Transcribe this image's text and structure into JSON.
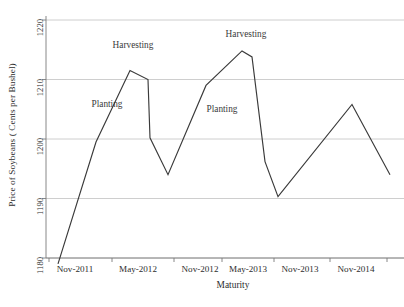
{
  "chart_data": {
    "type": "line",
    "title": "",
    "xlabel": "Maturity",
    "ylabel": "Price of Soybeans ( Cents per Bushel)",
    "ylim": [
      1180,
      1220
    ],
    "yticks": [
      1180,
      1190,
      1200,
      1210,
      1220
    ],
    "ytick_labels": [
      "1180",
      "1190",
      "1200",
      "1210",
      "1220"
    ],
    "grid": true,
    "gridlines": "horizontal",
    "legend": "none",
    "xtick_labels": [
      "Nov-2011",
      "May-2012",
      "Nov-2012",
      "May-2013",
      "Nov-2013",
      "Nov-2014"
    ],
    "xtick_px": [
      49,
      112,
      174,
      222,
      274,
      330
    ],
    "xtick_extra_px": [
      387
    ],
    "series": [
      {
        "name": "Soybean futures curve",
        "color": "#3a3a3a",
        "x": [
          58,
          96,
          130,
          148,
          150,
          168,
          206,
          242,
          252,
          265,
          278,
          352,
          390
        ],
        "values": [
          1179.0,
          1199.5,
          1211.5,
          1210.0,
          1200.2,
          1194.0,
          1209.0,
          1214.8,
          1213.8,
          1196.2,
          1190.3,
          1205.8,
          1194.0
        ]
      }
    ],
    "annotations": [
      {
        "text": "Harvesting",
        "x_px": 133,
        "y_px": 46
      },
      {
        "text": "Planting",
        "x_px": 107,
        "y_px": 105
      },
      {
        "text": "Planting",
        "x_px": 222,
        "y_px": 110
      },
      {
        "text": "Harvesting",
        "x_px": 246,
        "y_px": 35
      }
    ],
    "colors": {
      "line": "#3a3a3a",
      "grid": "#c8c8c8",
      "axis": "#7a7a7a",
      "text": "#2d2d2d",
      "background": "#ffffff"
    }
  }
}
